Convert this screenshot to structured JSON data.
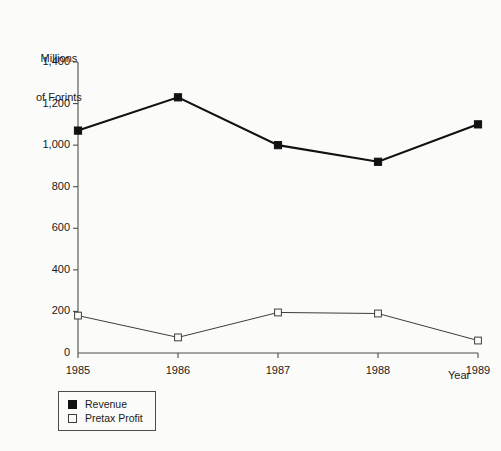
{
  "chart_data": {
    "type": "line",
    "title": "",
    "subtitle": "",
    "ylabel_line1": "Millions",
    "ylabel_line2": "of Forints",
    "xlabel": "Year",
    "categories": [
      "1985",
      "1986",
      "1987",
      "1988",
      "1989"
    ],
    "x": [
      1985,
      1986,
      1987,
      1988,
      1989
    ],
    "ylim": [
      0,
      1400
    ],
    "ytick_labels": [
      "0",
      "200",
      "400",
      "600",
      "800",
      "1,000",
      "1,200",
      "1,400"
    ],
    "ytick_values": [
      0,
      200,
      400,
      600,
      800,
      1000,
      1200,
      1400
    ],
    "grid": false,
    "legend_position": "below-left",
    "series": [
      {
        "name": "Revenue",
        "marker": "filled-square",
        "color": "#111111",
        "values": [
          1070,
          1230,
          1000,
          920,
          1100
        ]
      },
      {
        "name": "Pretax Profit",
        "marker": "open-square",
        "color": "#3d3d3d",
        "values": [
          180,
          75,
          195,
          190,
          60
        ]
      }
    ]
  },
  "legend": {
    "items": [
      {
        "label": "Revenue",
        "marker": "filled-square"
      },
      {
        "label": "Pretax Profit",
        "marker": "open-square"
      }
    ]
  },
  "colors": {
    "background": "#fbfbf9",
    "axis": "#4d4d4d",
    "revenue": "#111111",
    "pretax_profit": "#3d3d3d",
    "text": "#1a1a1a"
  }
}
